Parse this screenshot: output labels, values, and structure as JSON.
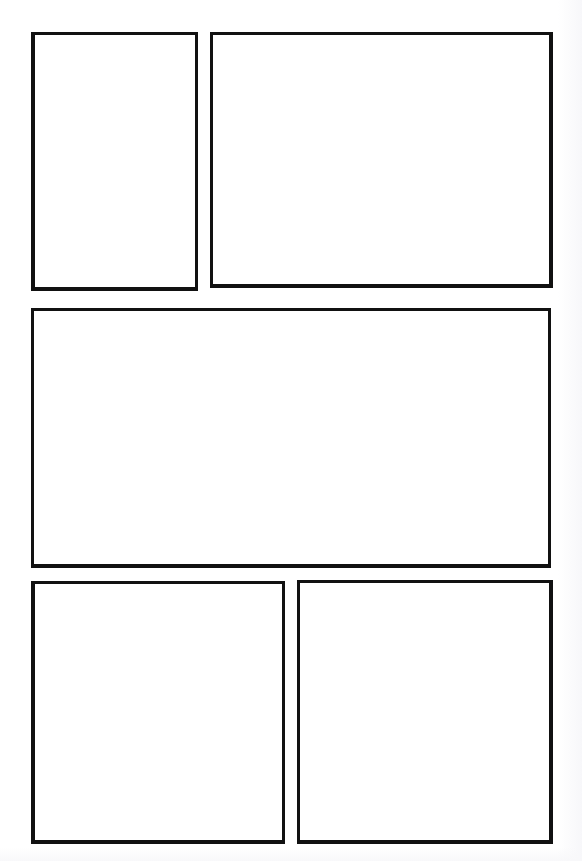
{
  "page": {
    "background_color": "#ffffff",
    "border_color": "#111111",
    "width": 582,
    "height": 861,
    "panel_count": 5,
    "row_count": 3
  },
  "panels": [
    {
      "id": "panel-1",
      "label": "",
      "content": "",
      "row": 1,
      "column": 1,
      "x": 31,
      "y": 32,
      "width": 167,
      "height": 259
    },
    {
      "id": "panel-2",
      "label": "",
      "content": "",
      "row": 1,
      "column": 2,
      "x": 210,
      "y": 32,
      "width": 343,
      "height": 256
    },
    {
      "id": "panel-3",
      "label": "",
      "content": "",
      "row": 2,
      "column": 1,
      "x": 31,
      "y": 308,
      "width": 520,
      "height": 260
    },
    {
      "id": "panel-4",
      "label": "",
      "content": "",
      "row": 3,
      "column": 1,
      "x": 31,
      "y": 581,
      "width": 254,
      "height": 263
    },
    {
      "id": "panel-5",
      "label": "",
      "content": "",
      "row": 3,
      "column": 2,
      "x": 297,
      "y": 580,
      "width": 256,
      "height": 264
    }
  ]
}
